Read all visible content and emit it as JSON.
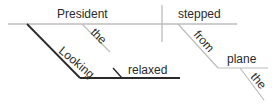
{
  "diagram": {
    "type": "sentence-diagram",
    "colors": {
      "line": "#bdbdbd",
      "heavy_line": "#2a2a2a",
      "text": "#2a2a2a"
    },
    "words": {
      "subject": "President",
      "subject_modifier": "the",
      "verb": "stepped",
      "preposition": "from",
      "prep_object": "plane",
      "prep_object_modifier": "the",
      "participle": "Looking",
      "participle_complement": "relaxed"
    }
  }
}
